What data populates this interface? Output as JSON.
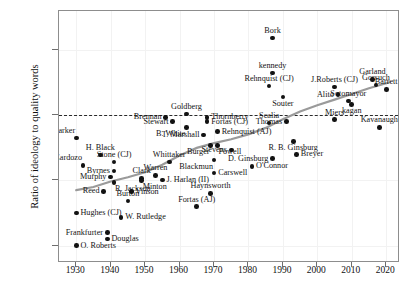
{
  "chart_data": {
    "type": "scatter",
    "title": "",
    "xlabel": "",
    "ylabel": "Ratio of ideology to quality words",
    "xlim": [
      1925,
      2024
    ],
    "ylim": [
      -0.68,
      0.48
    ],
    "xticks": [
      1930,
      1940,
      1950,
      1960,
      1970,
      1980,
      1990,
      2000,
      2010,
      2020
    ],
    "yticks": [
      0.3,
      0.0,
      -0.3,
      -0.6
    ],
    "ytick_labels": [
      "0.3",
      "0.0",
      "-0.3",
      "-0.6"
    ],
    "grid": true,
    "legend": null,
    "reference_line": {
      "y": 0.0,
      "style": "dashed",
      "color": "#2a2a2a"
    },
    "trend_line": {
      "style": "solid",
      "color": "#9a9a9a",
      "width": 2.2,
      "description": "smoothed upward trend from about -0.34 in 1930 to about 0.15 in 2020"
    },
    "point_color": "#121212",
    "points": [
      {
        "label": "Parker",
        "x": 1930.0,
        "y": -0.105,
        "pos": "left-above"
      },
      {
        "label": "Cardozo",
        "x": 1932.0,
        "y": -0.23,
        "pos": "left-above"
      },
      {
        "label": "H. Black",
        "x": 1937.0,
        "y": -0.182,
        "pos": "above"
      },
      {
        "label": "Byrnes",
        "x": 1941.0,
        "y": -0.256,
        "pos": "left"
      },
      {
        "label": "Stone (CJ)",
        "x": 1941.0,
        "y": -0.215,
        "pos": "above"
      },
      {
        "label": "Murphy",
        "x": 1940.0,
        "y": -0.285,
        "pos": "left"
      },
      {
        "label": "Reed",
        "x": 1938.0,
        "y": -0.35,
        "pos": "left"
      },
      {
        "label": "R. Jackson",
        "x": 1941.0,
        "y": -0.31,
        "pos": "right-below"
      },
      {
        "label": "Hughes (CJ)",
        "x": 1930.0,
        "y": -0.45,
        "pos": "right"
      },
      {
        "label": "Frankfurter",
        "x": 1939.0,
        "y": -0.54,
        "pos": "left"
      },
      {
        "label": "Douglas",
        "x": 1939.0,
        "y": -0.57,
        "pos": "right"
      },
      {
        "label": "O. Roberts",
        "x": 1930.0,
        "y": -0.6,
        "pos": "right"
      },
      {
        "label": "Burton",
        "x": 1945.0,
        "y": -0.395,
        "pos": "above"
      },
      {
        "label": "Vinson",
        "x": 1946.0,
        "y": -0.352,
        "pos": "right"
      },
      {
        "label": "Clark",
        "x": 1949.0,
        "y": -0.29,
        "pos": "above"
      },
      {
        "label": "Minton",
        "x": 1949.0,
        "y": -0.3,
        "pos": "right-below"
      },
      {
        "label": "W. Rutledge",
        "x": 1943.0,
        "y": -0.47,
        "pos": "right"
      },
      {
        "label": "Warren",
        "x": 1953.0,
        "y": -0.277,
        "pos": "above"
      },
      {
        "label": "Whittaker",
        "x": 1957.0,
        "y": -0.215,
        "pos": "above"
      },
      {
        "label": "J. Harlan (II)",
        "x": 1955.0,
        "y": -0.298,
        "pos": "right"
      },
      {
        "label": "Brennan",
        "x": 1956.0,
        "y": -0.01,
        "pos": "left"
      },
      {
        "label": "Stewart",
        "x": 1958.0,
        "y": -0.03,
        "pos": "left"
      },
      {
        "label": "Goldberg",
        "x": 1962.0,
        "y": 0.005,
        "pos": "above"
      },
      {
        "label": "B. White",
        "x": 1962.0,
        "y": -0.055,
        "pos": "left-below"
      },
      {
        "label": "T. Marshall",
        "x": 1967.0,
        "y": -0.09,
        "pos": "left"
      },
      {
        "label": "Thornberry",
        "x": 1968.0,
        "y": -0.01,
        "pos": "right"
      },
      {
        "label": "Fortas (CJ)",
        "x": 1968.0,
        "y": -0.03,
        "pos": "right"
      },
      {
        "label": "Fortas (AJ)",
        "x": 1965.0,
        "y": -0.42,
        "pos": "above"
      },
      {
        "label": "Burger",
        "x": 1969.0,
        "y": -0.14,
        "pos": "left-below"
      },
      {
        "label": "Powell",
        "x": 1971.0,
        "y": -0.14,
        "pos": "right-below"
      },
      {
        "label": "Rehnquist (AJ)",
        "x": 1971.0,
        "y": -0.075,
        "pos": "right"
      },
      {
        "label": "Blackmun",
        "x": 1970.0,
        "y": -0.205,
        "pos": "left-below"
      },
      {
        "label": "Carswell",
        "x": 1970.0,
        "y": -0.265,
        "pos": "right"
      },
      {
        "label": "O'Connor",
        "x": 1981.0,
        "y": -0.235,
        "pos": "right"
      },
      {
        "label": "Haynsworth",
        "x": 1969.0,
        "y": -0.36,
        "pos": "above"
      },
      {
        "label": "Stevens",
        "x": 1975.0,
        "y": -0.16,
        "pos": "left"
      },
      {
        "label": "D. Ginsburg",
        "x": 1987.0,
        "y": -0.2,
        "pos": "left"
      },
      {
        "label": "Scalia",
        "x": 1986.0,
        "y": -0.035,
        "pos": "above"
      },
      {
        "label": "Bork",
        "x": 1987.0,
        "y": 0.355,
        "pos": "above"
      },
      {
        "label": "kennedy",
        "x": 1987.0,
        "y": 0.195,
        "pos": "above"
      },
      {
        "label": "Rehnquist (CJ)",
        "x": 1986.0,
        "y": 0.135,
        "pos": "above"
      },
      {
        "label": "Souter",
        "x": 1990.0,
        "y": 0.085,
        "pos": "below"
      },
      {
        "label": "Thomas",
        "x": 1991.0,
        "y": -0.03,
        "pos": "left"
      },
      {
        "label": "R. B. Ginsburg",
        "x": 1993.0,
        "y": -0.12,
        "pos": "below"
      },
      {
        "label": "Breyer",
        "x": 1994.0,
        "y": -0.18,
        "pos": "right"
      },
      {
        "label": "J.Roberts (CJ)",
        "x": 2005.0,
        "y": 0.13,
        "pos": "above"
      },
      {
        "label": "Alito",
        "x": 2006.0,
        "y": 0.095,
        "pos": "left"
      },
      {
        "label": "Miers",
        "x": 2005.0,
        "y": -0.02,
        "pos": "above"
      },
      {
        "label": "Sotomayor",
        "x": 2009.0,
        "y": 0.065,
        "pos": "above"
      },
      {
        "label": "kagan",
        "x": 2010.0,
        "y": 0.05,
        "pos": "below"
      },
      {
        "label": "Garland",
        "x": 2016.0,
        "y": 0.165,
        "pos": "above"
      },
      {
        "label": "Gorsuch",
        "x": 2017.0,
        "y": 0.14,
        "pos": "above"
      },
      {
        "label": "Barrett",
        "x": 2020.0,
        "y": 0.12,
        "pos": "above"
      },
      {
        "label": "Kavanaugh",
        "x": 2018.0,
        "y": -0.055,
        "pos": "above"
      }
    ]
  }
}
